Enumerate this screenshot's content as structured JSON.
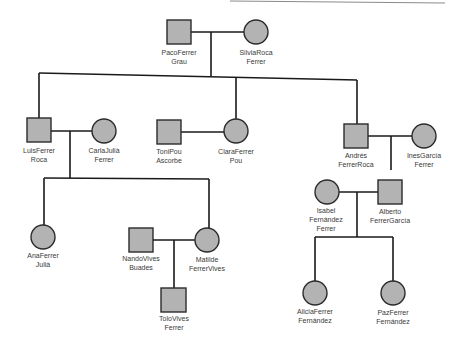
{
  "diagram": {
    "type": "family-tree",
    "colors": {
      "node_fill": "#b3b3b3",
      "line": "#1a1a1a",
      "text": "#3a3a3a"
    },
    "people": [
      {
        "id": "paco",
        "shape": "square",
        "line1": "PacoFerrer",
        "line2": "Grau"
      },
      {
        "id": "silvia",
        "shape": "circle",
        "line1": "SilviaRoca",
        "line2": "Ferrer"
      },
      {
        "id": "luis",
        "shape": "square",
        "line1": "LuisFerrer",
        "line2": "Roca"
      },
      {
        "id": "carla",
        "shape": "circle",
        "line1": "CarlaJulià",
        "line2": "Ferrer"
      },
      {
        "id": "toni",
        "shape": "square",
        "line1": "ToniPou",
        "line2": "Ascorbe"
      },
      {
        "id": "clara",
        "shape": "circle",
        "line1": "ClaraFerrer",
        "line2": "Pou"
      },
      {
        "id": "andres",
        "shape": "square",
        "line1": "Andrés",
        "line2": "FerrerRoca"
      },
      {
        "id": "ines",
        "shape": "circle",
        "line1": "InesGarcía",
        "line2": "Ferrer"
      },
      {
        "id": "isabel",
        "shape": "circle",
        "line1": "Isabel",
        "line2": "Fernández",
        "line3": "Ferrer"
      },
      {
        "id": "alberto",
        "shape": "square",
        "line1": "Alberto",
        "line2": "FerrerGarcía"
      },
      {
        "id": "ana",
        "shape": "circle",
        "line1": "AnaFerrer",
        "line2": "Julià"
      },
      {
        "id": "nando",
        "shape": "square",
        "line1": "NandoVives",
        "line2": "Buades"
      },
      {
        "id": "matilde",
        "shape": "circle",
        "line1": "Matilde",
        "line2": "FerrerVives"
      },
      {
        "id": "tolo",
        "shape": "square",
        "line1": "ToloVives",
        "line2": "Ferrer"
      },
      {
        "id": "alicia",
        "shape": "circle",
        "line1": "AliciaFerrer",
        "line2": "Fernández"
      },
      {
        "id": "paz",
        "shape": "circle",
        "line1": "PazFerrer",
        "line2": "Fernández"
      }
    ]
  }
}
